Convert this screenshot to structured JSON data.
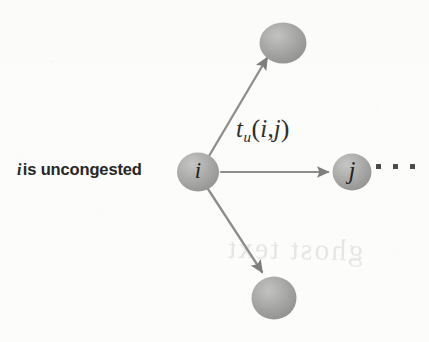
{
  "figure": {
    "type": "node-link-diagram",
    "background_color": "#fcfcfb",
    "caption": {
      "math_symbol": "i",
      "text": "is uncongested",
      "full_text": "i is uncongested"
    },
    "edge_label": {
      "base": "t",
      "subscript": "u",
      "open_paren": "(",
      "arg1": "i",
      "comma": ",",
      "arg2": "j",
      "close_paren": ")",
      "full_text": "tu(i,j)"
    },
    "nodes": [
      {
        "id": "node-top",
        "label": "",
        "labeled": false,
        "cx": 283,
        "cy": 43,
        "rx": 23,
        "ry": 20,
        "fill": "#a8a8a6"
      },
      {
        "id": "node-i",
        "label": "i",
        "labeled": true,
        "cx": 198,
        "cy": 172,
        "rx": 21,
        "ry": 19,
        "fill": "#aaaaa8"
      },
      {
        "id": "node-j",
        "label": "j",
        "labeled": true,
        "cx": 352,
        "cy": 172,
        "rx": 19,
        "ry": 18,
        "fill": "#aaaaa8"
      },
      {
        "id": "node-bottom",
        "label": "",
        "labeled": false,
        "cx": 274,
        "cy": 298,
        "rx": 22,
        "ry": 21,
        "fill": "#a8a8a6"
      }
    ],
    "edges": [
      {
        "id": "edge-i-to-top",
        "from": "node-i",
        "to": "node-top",
        "direction": "up-right",
        "label": "",
        "color": "#8d8d8b"
      },
      {
        "id": "edge-i-to-j",
        "from": "node-i",
        "to": "node-j",
        "direction": "right",
        "label": "tu(i,j)",
        "color": "#8d8d8b"
      },
      {
        "id": "edge-i-to-bottom",
        "from": "node-i",
        "to": "node-bottom",
        "direction": "down-right",
        "label": "",
        "color": "#8d8d8b"
      }
    ],
    "ellipsis": {
      "glyph": "· · ·",
      "dot_count": 3,
      "color": "#4a4a4a"
    },
    "bleed_through": {
      "visible": true,
      "text": "ghost text"
    },
    "colors": {
      "node_fill": "#aaaaa8",
      "node_shade": "#8e8e8c",
      "node_highlight": "#c4c4c2",
      "arrow": "#8d8d8b",
      "text": "#262626",
      "background": "#fcfcfb"
    }
  }
}
